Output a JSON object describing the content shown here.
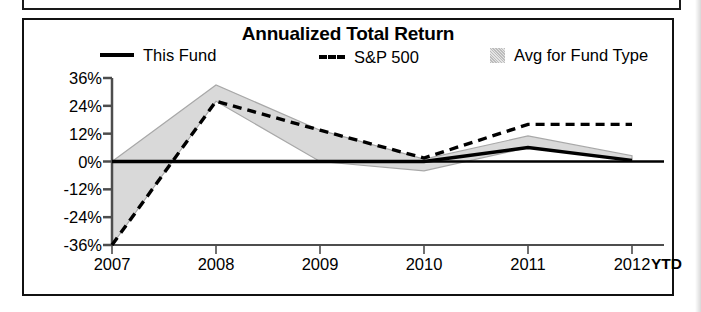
{
  "chart_panel": {
    "title": "Annualized Total Return"
  },
  "legend": {
    "entries": [
      {
        "label": "This Fund",
        "marker": "solid-line-swatch"
      },
      {
        "label": "S&P 500",
        "marker": "dashed-line-swatch"
      },
      {
        "label": "Avg for Fund Type",
        "marker": "shaded-area-swatch"
      }
    ]
  },
  "axis": {
    "y_ticks": [
      "36%",
      "24%",
      "12%",
      "0%",
      "-12%",
      "-24%",
      "-36%"
    ],
    "x_ticks": [
      "2007",
      "2008",
      "2009",
      "2010",
      "2011",
      "2012"
    ],
    "x_suffix": "YTD"
  },
  "colors": {
    "line": "#000000",
    "band_fill": "#d9d9d9",
    "band_edge": "#a8a8a8",
    "axis": "#4d4d4d",
    "panel_border": "#111111",
    "background": "#ffffff"
  },
  "chart_data": {
    "type": "line",
    "title": "Annualized Total Return",
    "xlabel": "",
    "ylabel": "",
    "categories": [
      "2007",
      "2008",
      "2009",
      "2010",
      "2011",
      "2012"
    ],
    "x_note": "2012 is YTD",
    "ylim": [
      -36,
      36
    ],
    "y_unit": "percent",
    "yticks": [
      36,
      24,
      12,
      0,
      -12,
      -24,
      -36
    ],
    "grid": false,
    "legend_position": "top",
    "series": [
      {
        "name": "This Fund",
        "style": "solid",
        "values": [
          0,
          0,
          0,
          0,
          6,
          0.5
        ]
      },
      {
        "name": "S&P 500",
        "style": "dashed",
        "values": [
          -36,
          26,
          13.5,
          1.5,
          16,
          16
        ]
      },
      {
        "name": "Avg for Fund Type",
        "style": "shaded-band",
        "upper": [
          0,
          33,
          13.5,
          1,
          11,
          2.5
        ],
        "lower": [
          -36,
          26,
          0,
          -4,
          6,
          0.5
        ]
      }
    ]
  }
}
